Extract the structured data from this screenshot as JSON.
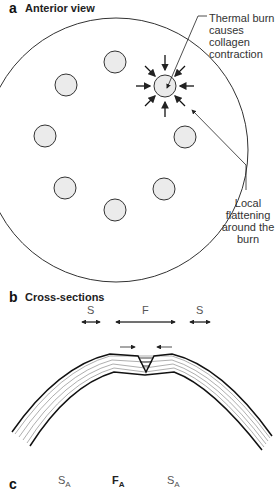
{
  "panel_a": {
    "letter": "a",
    "title": "Anterior view",
    "annotation_top": [
      "Thermal burn",
      "causes",
      "collagen",
      "contraction"
    ],
    "annotation_bottom": [
      "Local",
      "flattening",
      "around the",
      "burn"
    ]
  },
  "panel_b": {
    "letter": "b",
    "title": "Cross-sections",
    "labels": {
      "left": "S",
      "center": "F",
      "right": "S"
    }
  },
  "panel_c": {
    "letter": "c",
    "labels": {
      "left": "S",
      "left_sub": "A",
      "center": "F",
      "center_sub": "A",
      "right": "S",
      "right_sub": "A"
    }
  },
  "colors": {
    "line": "#222222",
    "spot_fill": "#e8e8e8",
    "label": "#555555"
  }
}
